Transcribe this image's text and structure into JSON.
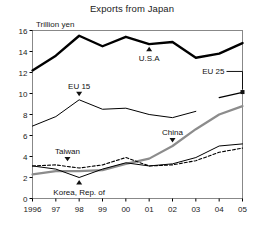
{
  "chart_data": {
    "type": "line",
    "title": "Exports from Japan",
    "ylabel": "Trillion yen",
    "xlabel": "",
    "ylim": [
      0,
      16
    ],
    "yticks": [
      0,
      2,
      4,
      6,
      8,
      10,
      12,
      14,
      16
    ],
    "ytick_labels": [
      "0",
      "2",
      "4",
      "6",
      "8",
      "10",
      "12",
      "14",
      "16"
    ],
    "x": [
      1996,
      1997,
      1998,
      1999,
      2000,
      2001,
      2002,
      2003,
      2004,
      2005
    ],
    "xtick_labels": [
      "1996",
      "97",
      "98",
      "99",
      "00",
      "01",
      "02",
      "03",
      "04",
      "05"
    ],
    "grid": false,
    "legend": "annotations-inline",
    "series": [
      {
        "name": "U.S.A",
        "style": "thick-solid",
        "color": "#000000",
        "x": [
          1996,
          1997,
          1998,
          1999,
          2000,
          2001,
          2002,
          2003,
          2004,
          2005
        ],
        "values": [
          12.2,
          13.6,
          15.5,
          14.5,
          15.4,
          14.7,
          14.9,
          13.4,
          13.8,
          14.8
        ]
      },
      {
        "name": "EU 15",
        "style": "thin-solid",
        "color": "#000000",
        "x": [
          1996,
          1997,
          1998,
          1999,
          2000,
          2001,
          2002,
          2003
        ],
        "values": [
          6.9,
          7.8,
          9.4,
          8.5,
          8.6,
          8.0,
          7.7,
          8.3
        ]
      },
      {
        "name": "EU 25",
        "style": "thin-solid-segment",
        "color": "#000000",
        "x": [
          2004,
          2005
        ],
        "values": [
          9.6,
          10.1
        ]
      },
      {
        "name": "China",
        "style": "thick-grey",
        "color": "#8c8c8c",
        "x": [
          1996,
          1997,
          1998,
          1999,
          2000,
          2001,
          2002,
          2003,
          2004,
          2005
        ],
        "values": [
          2.3,
          2.6,
          2.6,
          2.7,
          3.3,
          3.8,
          5.0,
          6.6,
          8.0,
          8.8
        ]
      },
      {
        "name": "Taiwan",
        "style": "dashed",
        "color": "#000000",
        "x": [
          1996,
          1997,
          1998,
          1999,
          2000,
          2001,
          2002,
          2003,
          2004,
          2005
        ],
        "values": [
          3.1,
          3.2,
          2.9,
          3.2,
          3.9,
          3.1,
          3.2,
          3.6,
          4.4,
          4.8
        ]
      },
      {
        "name": "Korea, Rep. of",
        "style": "thin-solid",
        "color": "#000000",
        "x": [
          1996,
          1997,
          1998,
          1999,
          2000,
          2001,
          2002,
          2003,
          2004,
          2005
        ],
        "values": [
          3.1,
          2.8,
          2.0,
          2.8,
          3.4,
          3.1,
          3.3,
          3.9,
          5.0,
          5.2
        ]
      }
    ],
    "annotations": [
      {
        "label": "U.S.A",
        "pointer": "up",
        "value_at": 14.7,
        "year": 2001
      },
      {
        "label": "EU 15",
        "pointer": "down",
        "value_at": 9.4,
        "year": 1998
      },
      {
        "label": "EU 25",
        "pointer": "elbow",
        "value_at": 10.1,
        "year": 2005
      },
      {
        "label": "China",
        "pointer": "down",
        "value_at": 5.0,
        "year": 2002
      },
      {
        "label": "Taiwan",
        "pointer": "down",
        "value_at": 3.2,
        "year": 1997.5
      },
      {
        "label": "Korea, Rep. of",
        "pointer": "up",
        "value_at": 2.0,
        "year": 1998
      }
    ]
  },
  "colors": {
    "axis": "#000000",
    "usa": "#000000",
    "eu": "#000000",
    "china": "#8c8c8c",
    "taiwan": "#000000",
    "korea": "#000000",
    "background": "#ffffff"
  }
}
